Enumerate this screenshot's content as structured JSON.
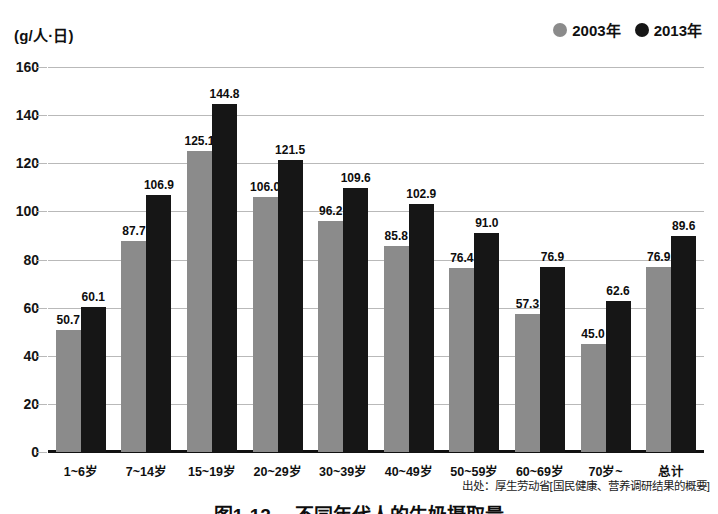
{
  "chart_data": {
    "type": "bar",
    "title": "图1-12 　不同年代人的牛奶摄取量",
    "unit_label": "(g/人·日)",
    "xlabel": "",
    "ylabel": "",
    "ylim": [
      0,
      160
    ],
    "ytick_step": 20,
    "yticks": [
      "160",
      "140",
      "120",
      "100",
      "80",
      "60",
      "40",
      "20",
      "0"
    ],
    "grid": true,
    "legend_position": "top-right",
    "categories": [
      "1~6岁",
      "7~14岁",
      "15~19岁",
      "20~29岁",
      "30~39岁",
      "40~49岁",
      "50~59岁",
      "60~69岁",
      "70岁~",
      "总计"
    ],
    "series": [
      {
        "name": "2003年",
        "color": "#8b8b8b",
        "values": [
          50.7,
          87.7,
          125.1,
          106.0,
          96.2,
          85.8,
          76.4,
          57.3,
          45.0,
          76.9
        ],
        "labels": [
          "50.7",
          "87.7",
          "125.1",
          "106.0",
          "96.2",
          "85.8",
          "76.4",
          "57.3",
          "45.0",
          "76.9"
        ]
      },
      {
        "name": "2013年",
        "color": "#161616",
        "values": [
          60.1,
          106.9,
          144.8,
          121.5,
          109.6,
          102.9,
          91.0,
          76.9,
          62.6,
          89.6
        ],
        "labels": [
          "60.1",
          "106.9",
          "144.8",
          "121.5",
          "109.6",
          "102.9",
          "91.0",
          "76.9",
          "62.6",
          "89.6"
        ]
      }
    ],
    "source_note": "出处：厚生劳动省[国民健康、营养调研结果的概要]"
  },
  "legend": {
    "items": [
      {
        "label": "2003年",
        "marker": "filled-circle-icon",
        "color": "#8b8b8b"
      },
      {
        "label": "2013年",
        "marker": "filled-circle-icon",
        "color": "#161616"
      }
    ]
  }
}
